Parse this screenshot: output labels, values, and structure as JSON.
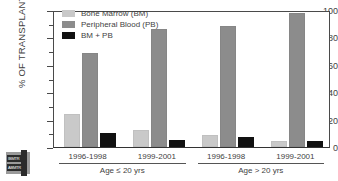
{
  "chart_data": {
    "type": "bar",
    "title": "",
    "xlabel": "",
    "ylabel": "% OF TRANSPLANTS",
    "ylim": [
      0,
      100
    ],
    "yticks": [
      0,
      20,
      40,
      60,
      80,
      100
    ],
    "ytick_labels": [
      "0",
      "20",
      "40",
      "60",
      "80",
      "100"
    ],
    "yminor_ticks": [
      10,
      30,
      50,
      70,
      90
    ],
    "grid": false,
    "legend_position": "upper-left-inside",
    "categories": [
      "1996-1998",
      "1999-2001",
      "1996-1998",
      "1999-2001"
    ],
    "group_labels": [
      "Age ≤ 20 yrs",
      "Age > 20 yrs"
    ],
    "series": [
      {
        "name": "Bone Marrow (BM)",
        "color": "#c9c9c9",
        "values": [
          23,
          11,
          7,
          3
        ]
      },
      {
        "name": "Peripheral Blood (PB)",
        "color": "#8c8c8c",
        "values": [
          67,
          85,
          87,
          96
        ]
      },
      {
        "name": "BM + PB",
        "color": "#111111",
        "values": [
          9,
          4,
          6,
          3
        ]
      }
    ]
  },
  "legend": {
    "items": [
      {
        "label": "Bone Marrow (BM)",
        "color": "#c9c9c9"
      },
      {
        "label": "Peripheral Blood (PB)",
        "color": "#8c8c8c"
      },
      {
        "label": "BM + PB",
        "color": "#111111"
      }
    ]
  },
  "logo": {
    "line1": "IBMTR",
    "line2": "ABMTR"
  }
}
